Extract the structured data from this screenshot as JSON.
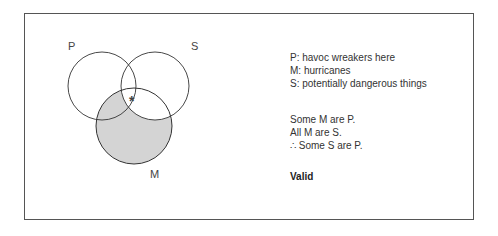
{
  "diagram": {
    "type": "venn-3-circle",
    "circles": [
      {
        "id": "P",
        "label": "P"
      },
      {
        "id": "S",
        "label": "S"
      },
      {
        "id": "M",
        "label": "M"
      }
    ],
    "shading_color": "#d4d4d4",
    "shaded_region": "M outside S",
    "mark": {
      "symbol": "*",
      "region": "M ∩ P ∩ S"
    }
  },
  "legend": [
    "P:  havoc wreakers here",
    "M:  hurricanes",
    "S:  potentially dangerous things"
  ],
  "premises": [
    "Some M are P.",
    "All M are S.",
    "∴ Some S are P."
  ],
  "verdict": "Valid"
}
